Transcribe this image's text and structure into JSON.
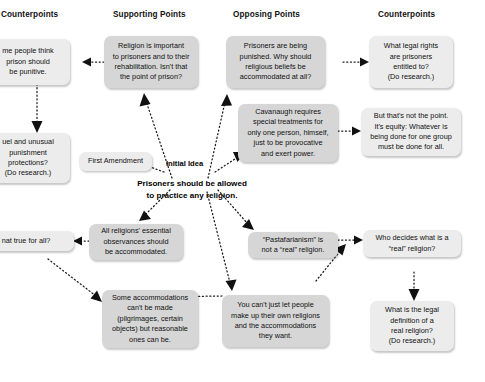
{
  "diagram": {
    "background_color": "#ffffff",
    "node_fill": "#d6d6d6",
    "node_fill_light": "#ececec",
    "connector_color": "#1a1a1a",
    "connector_style": "dotted-arrow"
  },
  "columns": [
    {
      "id": "counterpoints-left",
      "label": "Counterpoints"
    },
    {
      "id": "supporting-points",
      "label": "Supporting Points"
    },
    {
      "id": "opposing-points",
      "label": "Opposing Points"
    },
    {
      "id": "counterpoints-right",
      "label": "Counterpoints"
    }
  ],
  "center": {
    "label": "Initial Idea",
    "statement": "Prisoners should be allowed\nto practice any religion."
  },
  "nodes": [
    {
      "id": "node-punitive",
      "column": "counterpoints-left",
      "text": "me people think\nprison should\nbe punitive.",
      "clipped": true
    },
    {
      "id": "node-cruel-unusual",
      "column": "counterpoints-left",
      "text": "uel and unusual\npunishment\nprotections?\n(Do research.)",
      "clipped": true
    },
    {
      "id": "node-true-for-all",
      "column": "counterpoints-left",
      "text": "nat true for all?",
      "clipped": true
    },
    {
      "id": "node-religion-important",
      "column": "supporting-points",
      "text": "Religion is important\nto prisoners and to their\nrehabilitation. Isn't that\nthe point of prison?"
    },
    {
      "id": "node-first-amendment",
      "column": "supporting-points",
      "text": "First Amendment"
    },
    {
      "id": "node-all-religions",
      "column": "supporting-points",
      "text": "All religions' essential\nobservances should\nbe accommodated."
    },
    {
      "id": "node-some-accommodations",
      "column": "supporting-points",
      "text": "Some accommodations\ncan't be made\n(pilgrimages, certain\nobjects) but reasonable\nones can be."
    },
    {
      "id": "node-prisoners-punished",
      "column": "opposing-points",
      "text": "Prisoners are being\npunished. Why should\nreligious beliefs be\naccommodated at all?"
    },
    {
      "id": "node-cavanaugh",
      "column": "opposing-points",
      "text": "Cavanaugh requires\nspecial treatments for\nonly one person, himself,\njust to be provocative\nand exert power."
    },
    {
      "id": "node-pastafarianism",
      "column": "opposing-points",
      "text": "“Pastafarianism” is\nnot a “real” religion."
    },
    {
      "id": "node-make-up-religions",
      "column": "opposing-points",
      "text": "You can't just let people\nmake up their own religions\nand the accommodations\nthey want."
    },
    {
      "id": "node-legal-rights",
      "column": "counterpoints-right",
      "text": "What legal rights\nare prisoners\nentitled to?\n(Do research.)"
    },
    {
      "id": "node-equity",
      "column": "counterpoints-right",
      "text": "But that's not the point.\nIt's equity: Whatever is\nbeing done for one group\nmust be done for all."
    },
    {
      "id": "node-who-decides",
      "column": "counterpoints-right",
      "text": "Who decides what is a\n“real” religion?"
    },
    {
      "id": "node-legal-definition",
      "column": "counterpoints-right",
      "text": "What is the legal\ndefinition of a\nreal religion?\n(Do research.)"
    }
  ]
}
